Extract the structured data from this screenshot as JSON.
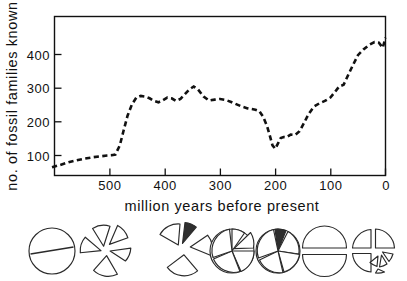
{
  "figure": {
    "background_color": "#ffffff",
    "ink_color": "#111111"
  },
  "axes": {
    "y_title": "no. of fossil families known",
    "x_title": "million years before present",
    "y_ticks": [
      "100",
      "200",
      "300",
      "400"
    ],
    "x_ticks": [
      "500",
      "400",
      "300",
      "200",
      "100",
      "0"
    ]
  },
  "chart_data": {
    "type": "line",
    "title": "",
    "xlabel": "million years before present",
    "ylabel": "no. of fossil families known",
    "xlim": [
      620,
      0
    ],
    "ylim": [
      0,
      480
    ],
    "x_reversed": true,
    "grid": false,
    "legend": "none",
    "line_style": "dashed",
    "line_color": "#111111",
    "x_tick_values": [
      500,
      400,
      300,
      200,
      100,
      0
    ],
    "y_tick_values": [
      100,
      200,
      300,
      400
    ],
    "series": [
      {
        "name": "fossil families known",
        "x": [
          605,
          590,
          575,
          560,
          545,
          530,
          515,
          505,
          497,
          490,
          482,
          475,
          468,
          460,
          452,
          444,
          436,
          428,
          420,
          412,
          404,
          396,
          388,
          380,
          372,
          364,
          356,
          348,
          340,
          330,
          320,
          310,
          300,
          290,
          280,
          270,
          260,
          250,
          243,
          236,
          229,
          222,
          215,
          210,
          205,
          200,
          195,
          190,
          185,
          180,
          172,
          164,
          156,
          148,
          140,
          130,
          120,
          110,
          100,
          92,
          84,
          76,
          66,
          58,
          50,
          40,
          30,
          20,
          12,
          5,
          0
        ],
        "y": [
          65,
          72,
          80,
          86,
          91,
          95,
          98,
          100,
          101,
          103,
          130,
          175,
          218,
          252,
          272,
          277,
          275,
          270,
          262,
          258,
          264,
          272,
          270,
          262,
          268,
          282,
          296,
          305,
          296,
          275,
          263,
          266,
          268,
          265,
          259,
          252,
          245,
          240,
          238,
          236,
          232,
          215,
          188,
          160,
          130,
          120,
          136,
          152,
          155,
          154,
          162,
          161,
          172,
          196,
          222,
          245,
          255,
          262,
          272,
          288,
          305,
          310,
          345,
          372,
          398,
          415,
          428,
          437,
          435,
          420,
          450
        ]
      }
    ],
    "annotations": [
      {
        "label": "low Precambrian/Cambrian baseline",
        "x": 600,
        "y": 65
      },
      {
        "label": "Ordovician radiation",
        "x": 460,
        "y": 272
      },
      {
        "label": "Devonian peak",
        "x": 420,
        "y": 305
      },
      {
        "label": "end-Permian minimum",
        "x": 210,
        "y": 120
      },
      {
        "label": "Cenozoic rise",
        "x": 0,
        "y": 450
      }
    ]
  },
  "pie_row": {
    "description": "faunal composition diagrams",
    "pies": [
      {
        "name": "pie-1",
        "style": "split-circle",
        "segments": 2
      },
      {
        "name": "pie-2",
        "style": "exploded",
        "segments": 5
      },
      {
        "name": "pie-3",
        "style": "exploded",
        "segments": 4
      },
      {
        "name": "pie-4",
        "style": "partly-exploded",
        "segments": 5
      },
      {
        "name": "pie-5",
        "style": "solid-with-dark-wedge",
        "segments": 5
      },
      {
        "name": "pie-6",
        "style": "split-halves",
        "segments": 2
      },
      {
        "name": "pie-7",
        "style": "exploded-quadrants",
        "segments": 7
      }
    ]
  }
}
